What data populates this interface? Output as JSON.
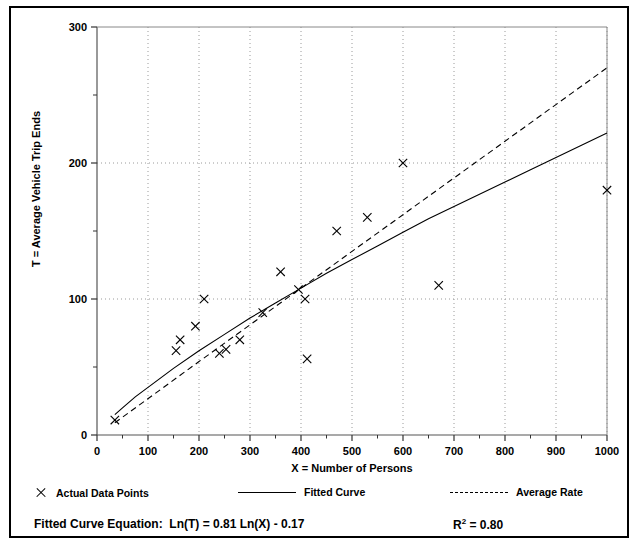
{
  "chart_data": {
    "type": "scatter",
    "title": "",
    "xlabel": "X = Number of Persons",
    "ylabel": "T = Average Vehicle Trip Ends",
    "xlim": [
      0,
      1000
    ],
    "ylim": [
      0,
      300
    ],
    "xticks": [
      0,
      100,
      200,
      300,
      400,
      500,
      600,
      700,
      800,
      900,
      1000
    ],
    "yticks": [
      0,
      100,
      200,
      300
    ],
    "yminorticks": [
      50,
      150,
      250
    ],
    "grid": "dotted gridlines at major x and y ticks",
    "legend_position": "below-axes",
    "series": [
      {
        "name": "Actual Data Points",
        "type": "scatter",
        "marker": "x",
        "points": [
          {
            "x": 35,
            "y": 11
          },
          {
            "x": 155,
            "y": 62
          },
          {
            "x": 163,
            "y": 70
          },
          {
            "x": 193,
            "y": 80
          },
          {
            "x": 210,
            "y": 100
          },
          {
            "x": 240,
            "y": 60
          },
          {
            "x": 253,
            "y": 63
          },
          {
            "x": 280,
            "y": 70
          },
          {
            "x": 325,
            "y": 90
          },
          {
            "x": 360,
            "y": 120
          },
          {
            "x": 395,
            "y": 107
          },
          {
            "x": 408,
            "y": 100
          },
          {
            "x": 412,
            "y": 56
          },
          {
            "x": 470,
            "y": 150
          },
          {
            "x": 530,
            "y": 160
          },
          {
            "x": 600,
            "y": 200
          },
          {
            "x": 670,
            "y": 110
          },
          {
            "x": 1000,
            "y": 180
          }
        ]
      },
      {
        "name": "Fitted Curve",
        "type": "line",
        "style": "solid",
        "equation": "Ln(T) = 0.81 Ln(X) - 0.17",
        "points": [
          {
            "x": 35,
            "y": 15
          },
          {
            "x": 50,
            "y": 20
          },
          {
            "x": 75,
            "y": 28
          },
          {
            "x": 100,
            "y": 35
          },
          {
            "x": 150,
            "y": 49
          },
          {
            "x": 200,
            "y": 62
          },
          {
            "x": 250,
            "y": 74
          },
          {
            "x": 300,
            "y": 86
          },
          {
            "x": 350,
            "y": 97
          },
          {
            "x": 400,
            "y": 108
          },
          {
            "x": 450,
            "y": 119
          },
          {
            "x": 500,
            "y": 129
          },
          {
            "x": 550,
            "y": 139
          },
          {
            "x": 600,
            "y": 149
          },
          {
            "x": 650,
            "y": 159
          },
          {
            "x": 700,
            "y": 168
          },
          {
            "x": 750,
            "y": 177
          },
          {
            "x": 800,
            "y": 186
          },
          {
            "x": 850,
            "y": 195
          },
          {
            "x": 900,
            "y": 204
          },
          {
            "x": 950,
            "y": 213
          },
          {
            "x": 1000,
            "y": 222
          }
        ]
      },
      {
        "name": "Average Rate",
        "type": "line",
        "style": "dashed",
        "points": [
          {
            "x": 35,
            "y": 9
          },
          {
            "x": 200,
            "y": 54
          },
          {
            "x": 400,
            "y": 108
          },
          {
            "x": 600,
            "y": 162
          },
          {
            "x": 800,
            "y": 216
          },
          {
            "x": 1000,
            "y": 270
          }
        ]
      }
    ],
    "annotations": {
      "equation_label": "Fitted Curve Equation:",
      "equation_value": "Ln(T) = 0.81 Ln(X) - 0.17",
      "r_squared_label": "R",
      "r_squared_sup": "2",
      "r_squared_value": "= 0.80"
    }
  },
  "legend": {
    "items": [
      {
        "label": "Actual Data Points",
        "marker": "x-marker-icon"
      },
      {
        "label": "Fitted Curve",
        "marker": "solid-line-icon"
      },
      {
        "label": "Average Rate",
        "marker": "dashed-line-icon"
      }
    ]
  },
  "axes": {
    "x_title": "X = Number of Persons",
    "y_title": "T = Average Vehicle Trip Ends",
    "x_tick_labels": [
      "0",
      "100",
      "200",
      "300",
      "400",
      "500",
      "600",
      "700",
      "800",
      "900",
      "1000"
    ],
    "y_tick_labels": [
      "0",
      "100",
      "200",
      "300"
    ]
  },
  "colors": {
    "ink": "#000000",
    "grid": "#9a9a9a",
    "background": "#ffffff"
  }
}
